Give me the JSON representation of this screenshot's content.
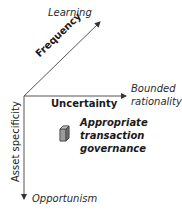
{
  "diagram": {
    "axes": {
      "frequency": {
        "label": "Frequency",
        "end_label": "Learning"
      },
      "uncertainty": {
        "label": "Uncertainty",
        "end_label_line1": "Bounded",
        "end_label_line2": "rationality"
      },
      "asset_specificity": {
        "label": "Asset specificity",
        "end_label": "Opportunism"
      }
    },
    "center": {
      "icon": "cube-icon",
      "line1": "Appropriate",
      "line2": "transaction",
      "line3": "governance"
    },
    "colors": {
      "axis": "#555555",
      "cube": "#8a8a8a"
    }
  }
}
